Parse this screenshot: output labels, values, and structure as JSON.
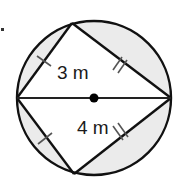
{
  "diagram": {
    "type": "geometry",
    "colors": {
      "stroke": "#111111",
      "shade": "#ebebeb",
      "tick": "#555555",
      "background": "#ffffff"
    },
    "circle": {
      "cx": 94,
      "cy": 98,
      "r": 77
    },
    "center_point": {
      "x": 94,
      "y": 98
    },
    "diameter": {
      "x1": 17,
      "y1": 98,
      "x2": 171,
      "y2": 98
    },
    "vertices": {
      "left": {
        "x": 17,
        "y": 98
      },
      "top": {
        "x": 72,
        "y": 23
      },
      "right": {
        "x": 171,
        "y": 98
      },
      "bottom": {
        "x": 74,
        "y": 174
      }
    },
    "labels": {
      "upper_side": "3 m",
      "lower_side": "4 m"
    },
    "tick_marks": {
      "upper_left": "single",
      "lower_left": "single",
      "upper_right": "double",
      "lower_right": "double"
    }
  }
}
